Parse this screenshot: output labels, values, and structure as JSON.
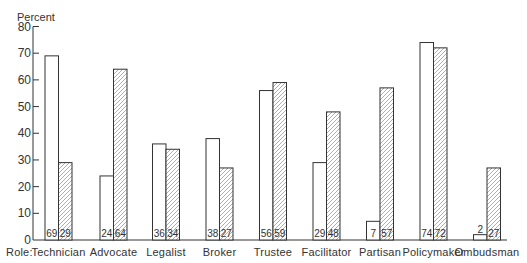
{
  "chart_data": {
    "type": "bar",
    "title": "",
    "ylabel": "Percent",
    "xlabel": "Role:",
    "ylim": [
      0,
      80
    ],
    "yticks": [
      0,
      10,
      20,
      30,
      40,
      50,
      60,
      70,
      80
    ],
    "grid": false,
    "legend": null,
    "categories": [
      "Technician",
      "Advocate",
      "Legalist",
      "Broker",
      "Trustee",
      "Facilitator",
      "Partisan",
      "Policymaker",
      "Ombudsman"
    ],
    "series": [
      {
        "name": "Series 1 (open bars)",
        "pattern": "none",
        "values": [
          69,
          24,
          36,
          38,
          56,
          29,
          7,
          74,
          2
        ]
      },
      {
        "name": "Series 2 (hatched bars)",
        "pattern": "diagonal-hatch",
        "values": [
          29,
          64,
          34,
          27,
          59,
          48,
          57,
          72,
          27
        ]
      }
    ],
    "annotations": "Each bar labeled with its value at the base (value above bar when bar too short)"
  },
  "colors": {
    "outline": "#333333",
    "hatch": "#9a9a9a",
    "open_fill": "#ffffff"
  }
}
